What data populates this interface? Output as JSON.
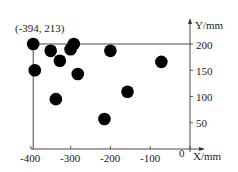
{
  "chart_data": {
    "type": "scatter",
    "title": "",
    "xlabel": "X/mm",
    "ylabel": "Y/mm",
    "xlim": [
      -400,
      0
    ],
    "ylim": [
      0,
      213
    ],
    "x_ticks": [
      -400,
      -300,
      -200,
      -100,
      0
    ],
    "y_ticks": [
      50,
      100,
      150,
      200
    ],
    "grid": false,
    "annotation": {
      "text": "(-394, 213)",
      "x": -394,
      "y": 213
    },
    "points": [
      {
        "x": -394,
        "y": 213
      },
      {
        "x": -350,
        "y": 187
      },
      {
        "x": -327,
        "y": 168
      },
      {
        "x": -300,
        "y": 190
      },
      {
        "x": -292,
        "y": 200
      },
      {
        "x": -200,
        "y": 187
      },
      {
        "x": -390,
        "y": 150
      },
      {
        "x": -282,
        "y": 143
      },
      {
        "x": -72,
        "y": 166
      },
      {
        "x": -337,
        "y": 95
      },
      {
        "x": -157,
        "y": 109
      },
      {
        "x": -215,
        "y": 57
      }
    ],
    "marker_color": "#000000",
    "axis_color": "#333333"
  },
  "labels": {
    "x_axis": "X/mm",
    "y_axis": "Y/mm",
    "origin": "0",
    "annotation": "(-394, 213)",
    "x_ticks": [
      "-400",
      "-300",
      "-200",
      "-100"
    ],
    "y_ticks": [
      "200",
      "150",
      "100",
      "50"
    ]
  }
}
